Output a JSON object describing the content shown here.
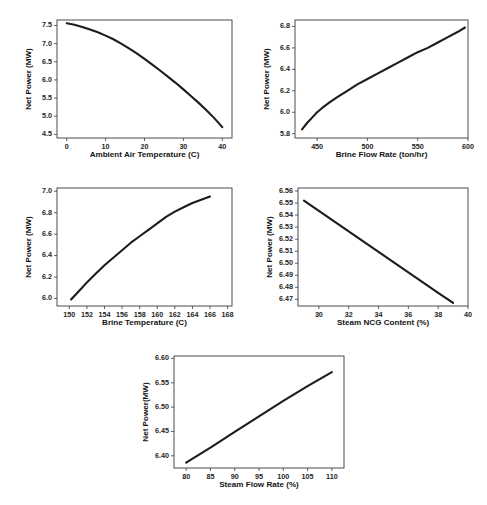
{
  "figure": {
    "background_color": "#ffffff",
    "line_color": "#1c1c1c",
    "axis_color": "#3a3a3a",
    "panel_count": 5
  },
  "chart_data": [
    {
      "id": "net-power-vs-ambient-air-temperature",
      "type": "line",
      "title": "",
      "xlabel": "Ambient Air Temperature (C)",
      "ylabel": "Net Power (MW)",
      "xlim": [
        -2.5,
        42.5
      ],
      "ylim": [
        4.4,
        7.65
      ],
      "xticks": [
        0,
        10,
        20,
        30,
        40
      ],
      "yticks": [
        4.5,
        5.0,
        5.5,
        6.0,
        6.5,
        7.0,
        7.5
      ],
      "xticklabels": [
        "0",
        "10",
        "20",
        "30",
        "40"
      ],
      "yticklabels": [
        "4.5",
        "5.0",
        "5.5",
        "6.0",
        "6.5",
        "7.0",
        "7.5"
      ],
      "grid": false,
      "legend": "none",
      "x": [
        0,
        2,
        4,
        6,
        8,
        10,
        12,
        14,
        16,
        18,
        20,
        22,
        24,
        26,
        28,
        30,
        32,
        34,
        36,
        38,
        40
      ],
      "y": [
        7.56,
        7.52,
        7.46,
        7.39,
        7.31,
        7.22,
        7.12,
        7.0,
        6.87,
        6.73,
        6.58,
        6.42,
        6.26,
        6.09,
        5.92,
        5.74,
        5.55,
        5.36,
        5.16,
        4.94,
        4.7
      ]
    },
    {
      "id": "net-power-vs-brine-flow-rate",
      "type": "line",
      "title": "",
      "xlabel": "Brine Flow Rate (ton/hr)",
      "ylabel": "Net Power (MW)",
      "xlim": [
        428,
        600
      ],
      "ylim": [
        5.76,
        6.86
      ],
      "xticks": [
        450,
        500,
        550,
        600
      ],
      "yticks": [
        5.8,
        6.0,
        6.2,
        6.4,
        6.6,
        6.8
      ],
      "xticklabels": [
        "450",
        "500",
        "550",
        "600"
      ],
      "yticklabels": [
        "5.8",
        "6.0",
        "6.2",
        "6.4",
        "6.6",
        "6.8"
      ],
      "grid": false,
      "legend": "none",
      "x": [
        435,
        440,
        445,
        450,
        455,
        462,
        470,
        480,
        490,
        500,
        510,
        520,
        530,
        540,
        550,
        560,
        570,
        580,
        590,
        597
      ],
      "y": [
        5.84,
        5.9,
        5.95,
        6.0,
        6.04,
        6.09,
        6.14,
        6.2,
        6.26,
        6.31,
        6.36,
        6.41,
        6.46,
        6.51,
        6.56,
        6.6,
        6.65,
        6.7,
        6.75,
        6.79
      ]
    },
    {
      "id": "net-power-vs-brine-temperature",
      "type": "line",
      "title": "",
      "xlabel": "Brine Temperature (C)",
      "ylabel": "Net Power (MW)",
      "xlim": [
        148.6,
        168.5
      ],
      "ylim": [
        5.93,
        7.03
      ],
      "xticks": [
        150,
        152,
        154,
        156,
        158,
        160,
        162,
        164,
        166,
        168
      ],
      "yticks": [
        6.0,
        6.2,
        6.4,
        6.6,
        6.8,
        7.0
      ],
      "xticklabels": [
        "150",
        "152",
        "154",
        "156",
        "158",
        "160",
        "162",
        "164",
        "166",
        "168"
      ],
      "yticklabels": [
        "6.0",
        "6.2",
        "6.4",
        "6.6",
        "6.8",
        "7.0"
      ],
      "grid": false,
      "legend": "none",
      "x": [
        150.2,
        151,
        152,
        153,
        154,
        155,
        156,
        157,
        158,
        159,
        160,
        161,
        162,
        163,
        164,
        165,
        166
      ],
      "y": [
        5.99,
        6.06,
        6.15,
        6.23,
        6.31,
        6.38,
        6.45,
        6.52,
        6.58,
        6.64,
        6.7,
        6.76,
        6.81,
        6.85,
        6.89,
        6.92,
        6.95
      ]
    },
    {
      "id": "net-power-vs-steam-ncg-content",
      "type": "line",
      "title": "",
      "xlabel": "Steam NCG Content (%)",
      "ylabel": "Net Power (MW)",
      "xlim": [
        28.6,
        40
      ],
      "ylim": [
        6.4645,
        6.5625
      ],
      "xticks": [
        30,
        32,
        34,
        36,
        38,
        40
      ],
      "yticks": [
        6.47,
        6.48,
        6.49,
        6.5,
        6.51,
        6.52,
        6.53,
        6.54,
        6.55,
        6.56
      ],
      "xticklabels": [
        "30",
        "32",
        "34",
        "36",
        "38",
        "40"
      ],
      "yticklabels": [
        "6.47",
        "6.48",
        "6.49",
        "6.50",
        "6.51",
        "6.52",
        "6.53",
        "6.54",
        "6.55",
        "6.56"
      ],
      "grid": false,
      "legend": "none",
      "x": [
        29,
        30,
        31,
        32,
        33,
        34,
        35,
        36,
        37,
        38,
        39
      ],
      "y": [
        6.552,
        6.5435,
        6.535,
        6.5265,
        6.518,
        6.5095,
        6.501,
        6.4925,
        6.484,
        6.4755,
        6.467
      ]
    },
    {
      "id": "net-power-vs-steam-flow-rate",
      "type": "line",
      "title": "",
      "xlabel": "Steam Flow Rate (%)",
      "ylabel": "Net Power(MW)",
      "xlim": [
        77.5,
        112.5
      ],
      "ylim": [
        6.375,
        6.605
      ],
      "xticks": [
        80,
        85,
        90,
        95,
        100,
        105,
        110
      ],
      "yticks": [
        6.4,
        6.45,
        6.5,
        6.55,
        6.6
      ],
      "xticklabels": [
        "80",
        "85",
        "90",
        "95",
        "100",
        "105",
        "110"
      ],
      "yticklabels": [
        "6.40",
        "6.45",
        "6.50",
        "6.55",
        "6.60"
      ],
      "grid": false,
      "legend": "none",
      "x": [
        80,
        85,
        90,
        95,
        100,
        105,
        110
      ],
      "y": [
        6.386,
        6.417,
        6.449,
        6.481,
        6.513,
        6.543,
        6.572
      ]
    }
  ],
  "panels": [
    {
      "name": "panel-ambient-air-temperature",
      "left": 24,
      "top": 12,
      "width": 216,
      "height": 158,
      "plot": {
        "x": 33,
        "y": 8,
        "w": 175,
        "h": 118
      }
    },
    {
      "name": "panel-brine-flow-rate",
      "left": 262,
      "top": 12,
      "width": 216,
      "height": 158,
      "plot": {
        "x": 33,
        "y": 8,
        "w": 173,
        "h": 118
      }
    },
    {
      "name": "panel-brine-temperature",
      "left": 24,
      "top": 180,
      "width": 216,
      "height": 158,
      "plot": {
        "x": 33,
        "y": 8,
        "w": 175,
        "h": 118
      }
    },
    {
      "name": "panel-steam-ncg-content",
      "left": 262,
      "top": 180,
      "width": 216,
      "height": 158,
      "plot": {
        "x": 36,
        "y": 8,
        "w": 170,
        "h": 118
      }
    },
    {
      "name": "panel-steam-flow-rate",
      "left": 138,
      "top": 348,
      "width": 216,
      "height": 152,
      "plot": {
        "x": 36,
        "y": 8,
        "w": 170,
        "h": 112
      }
    }
  ]
}
